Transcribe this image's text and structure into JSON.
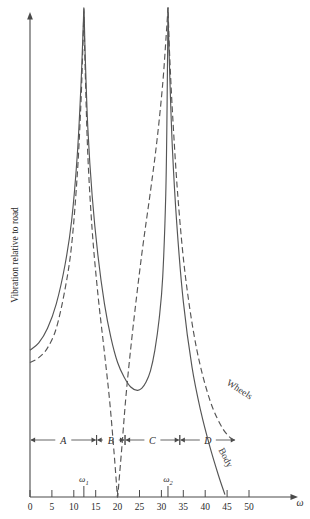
{
  "chart_data": {
    "type": "line",
    "title": "",
    "xlabel": "ω",
    "ylabel": "Vibration relative to road",
    "xlim": [
      0,
      53
    ],
    "ylim": [
      0,
      1
    ],
    "grid": false,
    "legend_position": "inline-curve-labels",
    "x_ticks": [
      0,
      5,
      10,
      15,
      20,
      25,
      30,
      35,
      40,
      45,
      50
    ],
    "x_tick_labels": [
      "0",
      "5",
      "10",
      "15",
      "20",
      "25",
      "30",
      "35",
      "40",
      "45",
      "50"
    ],
    "y_ticks": [],
    "y_tick_labels": [],
    "annotations": [
      {
        "name": "omega-1-marker",
        "label": "ω",
        "sub": "1",
        "x": 12.3
      },
      {
        "name": "omega-2-marker",
        "label": "ω",
        "sub": "2",
        "x": 31.5
      }
    ],
    "regions": [
      {
        "label": "A",
        "x_start": 0.0,
        "x_end": 15.2
      },
      {
        "label": "B",
        "x_start": 15.2,
        "x_end": 21.7
      },
      {
        "label": "C",
        "x_start": 21.7,
        "x_end": 34.2
      },
      {
        "label": "D",
        "x_start": 34.2,
        "x_end": 47.0
      }
    ],
    "series": [
      {
        "name": "Wheels",
        "style": "dashed",
        "color": "#555555",
        "label": "Wheels",
        "x": [
          0,
          2,
          4,
          6,
          8,
          9.5,
          10.8,
          11.6,
          12.0,
          12.2,
          12.3,
          12.4,
          12.6,
          13.2,
          14.2,
          15.5,
          17.0,
          18.2,
          19.2,
          19.8,
          20.0,
          20.3,
          21.0,
          22.0,
          23.5,
          25.5,
          27.5,
          29.0,
          30.3,
          31.1,
          31.4,
          31.5,
          31.6,
          31.9,
          32.6,
          33.8,
          35.5,
          38.0,
          41.0,
          44.0,
          46.5
        ],
        "y": [
          0.275,
          0.285,
          0.305,
          0.345,
          0.425,
          0.515,
          0.66,
          0.8,
          0.9,
          0.96,
          1.0,
          0.955,
          0.875,
          0.7,
          0.545,
          0.415,
          0.295,
          0.195,
          0.09,
          0.02,
          0.0,
          0.03,
          0.105,
          0.215,
          0.345,
          0.495,
          0.625,
          0.73,
          0.845,
          0.945,
          0.985,
          1.0,
          0.975,
          0.9,
          0.775,
          0.61,
          0.45,
          0.305,
          0.2,
          0.14,
          0.115
        ]
      },
      {
        "name": "Body",
        "style": "solid",
        "color": "#555555",
        "label": "Body",
        "x": [
          0,
          2,
          4,
          6,
          8,
          9.5,
          10.8,
          11.6,
          12.0,
          12.2,
          12.3,
          12.4,
          12.6,
          13.2,
          14.2,
          15.5,
          17.0,
          18.5,
          20.0,
          21.5,
          23.0,
          24.5,
          25.5,
          26.5,
          27.5,
          28.5,
          29.5,
          30.3,
          31.0,
          31.3,
          31.45,
          31.5,
          31.6,
          31.9,
          32.5,
          33.5,
          35.0,
          37.0,
          39.0,
          41.0,
          43.0,
          44.5
        ],
        "y": [
          0.3,
          0.315,
          0.345,
          0.395,
          0.475,
          0.565,
          0.7,
          0.835,
          0.925,
          0.975,
          1.0,
          0.975,
          0.905,
          0.755,
          0.615,
          0.495,
          0.395,
          0.325,
          0.275,
          0.245,
          0.225,
          0.218,
          0.222,
          0.235,
          0.258,
          0.3,
          0.365,
          0.45,
          0.62,
          0.8,
          0.94,
          1.0,
          0.96,
          0.865,
          0.715,
          0.56,
          0.4,
          0.265,
          0.175,
          0.105,
          0.045,
          0.005
        ]
      }
    ]
  },
  "axes": {
    "y_title": "Vibration relative to road",
    "x_symbol": "ω"
  }
}
